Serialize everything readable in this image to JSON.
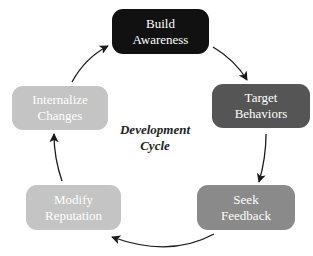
{
  "diagram": {
    "type": "cycle",
    "center_label": {
      "line1": "Development",
      "line2": "Cycle"
    },
    "nodes": [
      {
        "id": "build-awareness",
        "line1": "Build",
        "line2": "Awareness",
        "color": "#111111"
      },
      {
        "id": "target-behaviors",
        "line1": "Target",
        "line2": "Behaviors",
        "color": "#555555"
      },
      {
        "id": "seek-feedback",
        "line1": "Seek",
        "line2": "Feedback",
        "color": "#8a8a8a"
      },
      {
        "id": "modify-reputation",
        "line1": "Modify",
        "line2": "Reputation",
        "color": "#c4c4c4"
      },
      {
        "id": "internalize-changes",
        "line1": "Internalize",
        "line2": "Changes",
        "color": "#c4c4c4"
      }
    ],
    "edges": [
      {
        "from": "build-awareness",
        "to": "target-behaviors"
      },
      {
        "from": "target-behaviors",
        "to": "seek-feedback"
      },
      {
        "from": "seek-feedback",
        "to": "modify-reputation"
      },
      {
        "from": "modify-reputation",
        "to": "internalize-changes"
      },
      {
        "from": "internalize-changes",
        "to": "build-awareness"
      }
    ],
    "arrow_color": "#1a1a1a"
  }
}
